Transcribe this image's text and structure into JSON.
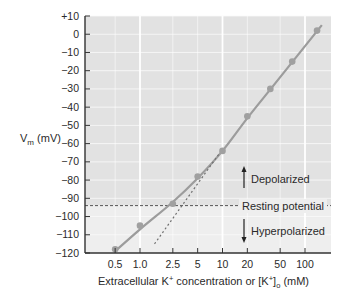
{
  "chart_data": {
    "type": "line",
    "title": "",
    "xlabel": "Extracellular K+ concentration or [K+]o (mM)",
    "xlabel_parts": {
      "prefix": "Extracellular K",
      "sup1": "+",
      "mid": " concentration or [K",
      "sup2": "+",
      "close": "]",
      "sub": "o",
      "suffix": " (mM)"
    },
    "ylabel": "Vm (mV)",
    "ylabel_parts": {
      "main": "V",
      "sub": "m",
      "suffix": " (mV)"
    },
    "xscale": "log",
    "xlim": [
      0.3,
      200
    ],
    "ylim": [
      -120,
      10
    ],
    "xticks": [
      0.5,
      1.0,
      2.5,
      5,
      10,
      20,
      50,
      100
    ],
    "xtick_labels": [
      "0.5",
      "1.0",
      "2.5",
      "5",
      "10",
      "20",
      "50",
      "100"
    ],
    "yticks": [
      10,
      0,
      -10,
      -20,
      -30,
      -40,
      -50,
      -60,
      -70,
      -80,
      -90,
      -100,
      -110,
      -120
    ],
    "ytick_labels": [
      "+10",
      "0",
      "−10",
      "−20",
      "−30",
      "−40",
      "−50",
      "−60",
      "−70",
      "−80",
      "−90",
      "−100",
      "−110",
      "−120"
    ],
    "grid": true,
    "series": [
      {
        "name": "Measured membrane potential",
        "style": "markers",
        "x": [
          0.5,
          1.0,
          2.5,
          5,
          10,
          20,
          38,
          70,
          140
        ],
        "y": [
          -118,
          -105,
          -93,
          -78,
          -64,
          -45,
          -30,
          -15,
          2
        ]
      },
      {
        "name": "Fitted curve",
        "style": "solid",
        "x": [
          0.5,
          1.0,
          2.5,
          5,
          10,
          20,
          40,
          80,
          160
        ],
        "y": [
          -119,
          -107,
          -92,
          -79,
          -64,
          -46,
          -29,
          -12,
          5
        ]
      },
      {
        "name": "Nernst prediction (E_K)",
        "style": "dotted",
        "x": [
          1.5,
          10
        ],
        "y": [
          -115,
          -63
        ]
      }
    ],
    "reference_lines": [
      {
        "name": "Resting potential",
        "axis": "y",
        "value": -94,
        "style": "dashed"
      }
    ],
    "annotations": [
      {
        "text": "Depolarized",
        "arrow": "up"
      },
      {
        "text": "Resting potential",
        "arrow": "none"
      },
      {
        "text": "Hyperpolarized",
        "arrow": "down"
      }
    ],
    "colors": {
      "background_above_rest": "#e2e2e2",
      "background_below_rest": "#eeeeee",
      "gridline": "#fafafa",
      "curve": "#9c9c9c",
      "marker": "#a0a0a0",
      "dashed_line": "#555555",
      "axis": "#333333"
    }
  }
}
